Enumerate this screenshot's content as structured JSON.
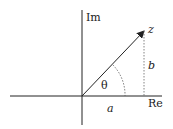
{
  "diagram": {
    "axes": {
      "vertical_label": "Im",
      "horizontal_label": "Re"
    },
    "point_label": "z",
    "angle_label": "θ",
    "real_part_label": "a",
    "imag_part_label": "b",
    "colors": {
      "ink": "#222222",
      "dotted": "#666666",
      "background": "#ffffff"
    }
  }
}
